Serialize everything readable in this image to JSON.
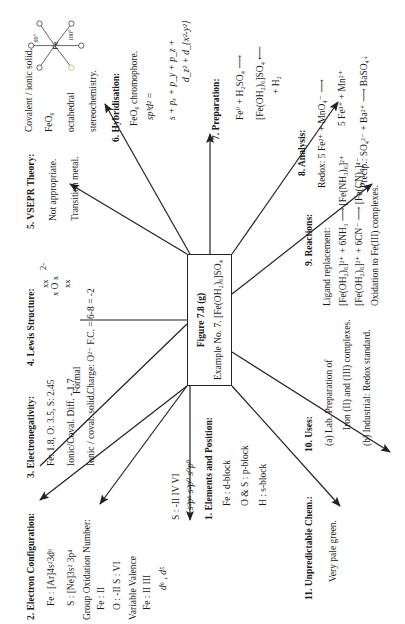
{
  "figure": {
    "title": "Figure 7.8 (g)",
    "subtitle_prefix": "Example No. 7.",
    "compound": "[Fe(OH₂)₆]SO₄"
  },
  "nodes": [
    {
      "id": 1,
      "heading_num": "1.",
      "heading": "Elements and Position:",
      "lines": [
        "Fe : d-block",
        "O & S : p-block",
        "H : s-block"
      ]
    },
    {
      "id": 2,
      "heading_num": "2.",
      "heading": "Electron Configuration:",
      "lines": [
        "Fe : [Ar]4s²3d⁶",
        "S : [Ne]3s² 3p⁴",
        "Group Oxidation Number:",
        "Fe : II",
        "O : -II   S : VI",
        "Variable Valence",
        "Fe : II    III",
        "d⁶ ,  d⁵",
        "S : -II    IV    VI",
        "s²p⁶   s²p⁰   s⁰p⁰"
      ]
    },
    {
      "id": 3,
      "heading_num": "3.",
      "heading": "Electronegativity:",
      "lines": [
        "Fe: 1.8, O: 3.5, S: 2.45",
        "Ionic/Coval.  Diff. - 1.7",
        "Ionic / coval.  solid."
      ]
    },
    {
      "id": 4,
      "heading_num": "4.",
      "heading": "Lewis Structure:",
      "lewis": {
        "top": "xx",
        "mid_left": "x",
        "atom": "O",
        "mid_right": "x",
        "bottom": "xx",
        "charge": "2-"
      },
      "lines": [
        "Formal",
        "Charge:  O²⁻ F.C. = 6-8 = -2"
      ]
    },
    {
      "id": 5,
      "heading_num": "5.",
      "heading": "VSEPR  Theory:",
      "lines": [
        "Not  appropriate.",
        "Transition   metal."
      ]
    },
    {
      "id": "5b",
      "lines": [
        "Covalent / ionic solid.",
        "FeO₆",
        "octahedral",
        "stereochemistry."
      ],
      "structure": {
        "center": "Fe",
        "ligand": "O",
        "angle_a": "90°",
        "angle_b": "180°"
      }
    },
    {
      "id": 6,
      "heading_num": "6.",
      "heading": "Hybridisation:",
      "lines": [
        "FeO₆  chromophore.",
        "sp³d²   =",
        "s + pₓ + p_y + p_z  +",
        "d_z² + d_{x²-y²}"
      ]
    },
    {
      "id": 7,
      "heading_num": "7.",
      "heading": "Preparation:",
      "lines": [
        "Fe⁰ + H₂SO₄  ⟶",
        "[Fe(OH₂)₆]SO₄  ⟵",
        "+ H₂"
      ]
    },
    {
      "id": 8,
      "heading_num": "8.",
      "heading": "Analysis:",
      "lines": [
        "Redox:  5 Fe²⁺ + MnO₄⁻  ⟶",
        "5  Fe³⁺  +  Mn²⁺",
        "Precip.:  SO₄²⁻ + Ba²⁺ ⟶ BaSO₄↓"
      ]
    },
    {
      "id": 9,
      "heading_num": "9.",
      "heading": "Reactions:",
      "lines": [
        "Ligand  replacement:",
        "[Fe(OH₂)₆]²⁺ +  6NH₃  ⟶  [Fe(NH₃)₆]²⁺",
        "[Fe(OH₂)₆]²⁺ +  6CN⁻  ⟶  [Fe(CN)₆]⁴⁻",
        "Oxidation to Fe(III) complexes."
      ]
    },
    {
      "id": 10,
      "heading_num": "10.",
      "heading": "Uses:",
      "lines": [
        "(a)  Lab.  Preparation of",
        "Iron (II) and (III) complexes.",
        "(b)  Industrial:  Redox  standard."
      ]
    },
    {
      "id": 11,
      "heading_num": "11.",
      "heading": "Unpredictable  Chem.:",
      "lines": [
        "Very pale green."
      ]
    }
  ],
  "colors": {
    "ink": "#1a1a1a",
    "background": "#ffffff",
    "ligand_highlight": "#b5b84a"
  }
}
